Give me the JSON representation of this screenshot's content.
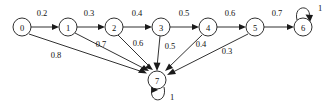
{
  "diagram": {
    "type": "directed-weighted-graph",
    "canvas": {
      "width": 331,
      "height": 108
    },
    "colors": {
      "background": "#ffffff",
      "stroke": "#1a1a1a",
      "text": "#111111"
    },
    "nodes": [
      {
        "id": "0",
        "label": "0",
        "cx": 22,
        "cy": 27,
        "r": 9
      },
      {
        "id": "1",
        "label": "1",
        "cx": 68,
        "cy": 27,
        "r": 9
      },
      {
        "id": "2",
        "label": "2",
        "cx": 114,
        "cy": 27,
        "r": 9
      },
      {
        "id": "3",
        "label": "3",
        "cx": 161,
        "cy": 27,
        "r": 9
      },
      {
        "id": "4",
        "label": "4",
        "cx": 208,
        "cy": 27,
        "r": 9
      },
      {
        "id": "5",
        "label": "5",
        "cx": 255,
        "cy": 27,
        "r": 9
      },
      {
        "id": "6",
        "label": "6",
        "cx": 303,
        "cy": 27,
        "r": 9
      },
      {
        "id": "7",
        "label": "7",
        "cx": 157,
        "cy": 80,
        "r": 9
      }
    ],
    "edges": [
      {
        "from": "0",
        "to": "1",
        "weight": "0.2",
        "label_x": 42,
        "label_y": 13
      },
      {
        "from": "1",
        "to": "2",
        "weight": "0.3",
        "label_x": 89,
        "label_y": 13
      },
      {
        "from": "2",
        "to": "3",
        "weight": "0.4",
        "label_x": 137,
        "label_y": 13
      },
      {
        "from": "3",
        "to": "4",
        "weight": "0.5",
        "label_x": 184,
        "label_y": 13
      },
      {
        "from": "4",
        "to": "5",
        "weight": "0.6",
        "label_x": 230,
        "label_y": 13
      },
      {
        "from": "5",
        "to": "6",
        "weight": "0.7",
        "label_x": 277,
        "label_y": 13
      },
      {
        "from": "0",
        "to": "7",
        "weight": "0.8",
        "label_x": 56,
        "label_y": 55
      },
      {
        "from": "1",
        "to": "7",
        "weight": "0.7",
        "label_x": 101,
        "label_y": 44
      },
      {
        "from": "2",
        "to": "7",
        "weight": "0.6",
        "label_x": 138,
        "label_y": 43
      },
      {
        "from": "3",
        "to": "7",
        "weight": "0.5",
        "label_x": 170,
        "label_y": 46
      },
      {
        "from": "4",
        "to": "7",
        "weight": "0.4",
        "label_x": 201,
        "label_y": 44
      },
      {
        "from": "5",
        "to": "7",
        "weight": "0.3",
        "label_x": 227,
        "label_y": 51
      }
    ],
    "self_loops": [
      {
        "node": "6",
        "weight": "1",
        "label_x": 320,
        "label_y": 8,
        "direction": "up"
      },
      {
        "node": "7",
        "weight": "1",
        "label_x": 172,
        "label_y": 97,
        "direction": "down"
      }
    ]
  }
}
